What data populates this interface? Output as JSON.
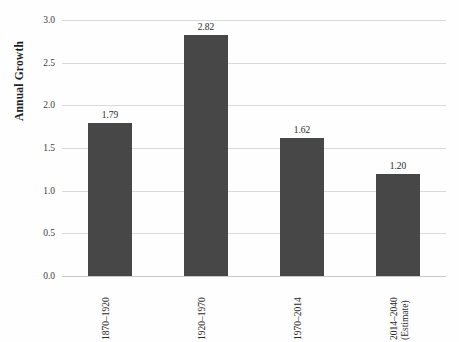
{
  "chart_data": {
    "type": "bar",
    "title": "",
    "subtitle": "",
    "xlabel": "",
    "ylabel": "Annual Growth",
    "categories": [
      "1870–1920",
      "1920–1970",
      "1970–2014",
      "2014–2040 (Estimate)"
    ],
    "category_lines": [
      [
        "1870–1920"
      ],
      [
        "1920–1970"
      ],
      [
        "1970–2014"
      ],
      [
        "2014–2040",
        "(Estimate)"
      ]
    ],
    "values": [
      1.79,
      2.82,
      1.62,
      1.2
    ],
    "value_labels": [
      "1.79",
      "2.82",
      "1.62",
      "1.20"
    ],
    "ylim": [
      0.0,
      3.0
    ],
    "ytick_values": [
      0.0,
      0.5,
      1.0,
      1.5,
      2.0,
      2.5,
      3.0
    ],
    "ytick_labels": [
      "0.0",
      "0.5",
      "1.0",
      "1.5",
      "2.0",
      "2.5",
      "3.0"
    ],
    "grid": "horizontal",
    "legend": "none",
    "bar_color": "#474747",
    "gridline_color": "#d9d9d9",
    "background_color": "#fefefe"
  }
}
